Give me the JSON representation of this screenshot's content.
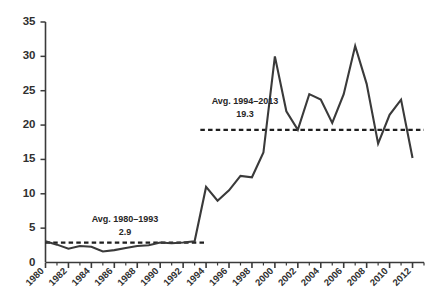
{
  "chart_data": {
    "type": "line",
    "title": "",
    "subtitle": "",
    "xlabel": "",
    "ylabel": "",
    "xlim": [
      1980,
      2013
    ],
    "ylim": [
      0,
      35
    ],
    "grid": false,
    "legend_position": "none",
    "y_ticks": [
      0,
      5,
      10,
      15,
      20,
      25,
      30,
      35
    ],
    "y_tick_labels": [
      "0",
      "5",
      "10",
      "15",
      "20",
      "25",
      "30",
      "35"
    ],
    "x_ticks_major": [
      1980,
      1982,
      1984,
      1986,
      1988,
      1990,
      1992,
      1994,
      1996,
      1998,
      2000,
      2002,
      2004,
      2006,
      2008,
      2010,
      2012
    ],
    "x_tick_labels": [
      "1980",
      "1982",
      "1984",
      "1986",
      "1988",
      "1990",
      "1992",
      "1994",
      "1996",
      "1998",
      "2000",
      "2002",
      "2004",
      "2006",
      "2008",
      "2010",
      "2012"
    ],
    "x_minor_tick_interval": 1,
    "series": [
      {
        "name": "value",
        "color": "#3a3a3a",
        "x": [
          1980,
          1981,
          1982,
          1983,
          1984,
          1985,
          1986,
          1987,
          1988,
          1989,
          1990,
          1991,
          1992,
          1993,
          1994,
          1995,
          1996,
          1997,
          1998,
          1999,
          2000,
          2001,
          2002,
          2003,
          2004,
          2005,
          2006,
          2007,
          2008,
          2009,
          2010,
          2011,
          2012
        ],
        "values": [
          3.1,
          2.6,
          2.0,
          2.4,
          2.3,
          1.6,
          1.8,
          2.1,
          2.4,
          2.5,
          2.9,
          2.8,
          2.9,
          3.1,
          11.0,
          9.0,
          10.5,
          12.6,
          12.4,
          16.0,
          30.0,
          22.0,
          19.3,
          24.5,
          23.7,
          20.3,
          24.5,
          31.5,
          26.0,
          17.3,
          21.5,
          23.7,
          15.2
        ]
      }
    ],
    "annotations": [
      {
        "name": "avg-1980-1993",
        "label": "Avg. 1980–1993",
        "value_label": "2.9",
        "value": 2.9,
        "x_start": 1980,
        "x_end": 1994,
        "style": "dashed"
      },
      {
        "name": "avg-1994-2013",
        "label": "Avg. 1994–2013",
        "value_label": "19.3",
        "value": 19.3,
        "x_start": 1993.5,
        "x_end": 2013,
        "style": "dashed"
      }
    ],
    "colors": {
      "line": "#3a3a3a",
      "axis": "#3a3a3a",
      "dashed": "#1f1f1f",
      "text": "#2b2b2b",
      "background": "#ffffff"
    }
  }
}
